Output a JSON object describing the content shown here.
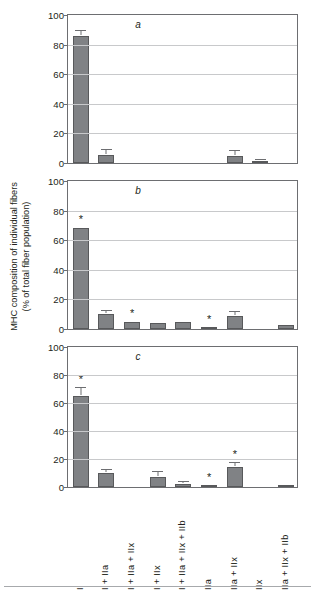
{
  "axis": {
    "y_title_line1": "MHC composition of individual fibers",
    "y_title_line2": "(% of total fiber population)",
    "y_ticks": [
      "0",
      "20",
      "40",
      "60",
      "80",
      "100"
    ]
  },
  "categories": [
    "I",
    "I + IIa",
    "I + IIa + IIx",
    "I + IIx",
    "I + IIa + IIx + IIb",
    "IIa",
    "IIa + IIx",
    "IIx",
    "IIa + IIx + IIb"
  ],
  "panels": [
    {
      "letter": "a"
    },
    {
      "letter": "b"
    },
    {
      "letter": "c"
    }
  ],
  "chart_data": {
    "type": "bar",
    "title": "",
    "xlabel": "",
    "ylabel": "MHC composition of individual fibers (% of total fiber population)",
    "ylim": [
      0,
      100
    ],
    "yticks": [
      0,
      20,
      40,
      60,
      80,
      100
    ],
    "grid": true,
    "legend": "none",
    "bar_color": "#808285",
    "categories": [
      "I",
      "I + IIa",
      "I + IIa + IIx",
      "I + IIx",
      "I + IIa + IIx + IIb",
      "IIa",
      "IIa + IIx",
      "IIx",
      "IIa + IIx + IIb"
    ],
    "panels": [
      {
        "label": "a",
        "values": [
          86,
          5.5,
          0,
          0,
          0,
          0,
          5,
          1.5,
          0
        ],
        "errors": [
          3.5,
          3,
          0,
          0,
          0,
          0,
          3,
          0.5,
          0
        ],
        "significance": [
          "",
          "",
          "",
          "",
          "",
          "",
          "",
          "",
          ""
        ]
      },
      {
        "label": "b",
        "values": [
          68,
          10,
          5,
          4,
          4.5,
          0.5,
          9,
          0,
          3
        ],
        "errors": [
          0,
          2.5,
          0,
          0,
          0,
          0,
          2.5,
          0,
          0
        ],
        "significance": [
          "*",
          "",
          "*",
          "",
          "",
          "*",
          "",
          "",
          ""
        ]
      },
      {
        "label": "c",
        "values": [
          65,
          10,
          0,
          7,
          2,
          0.5,
          14,
          0,
          1
        ],
        "errors": [
          6,
          2.5,
          0,
          3.5,
          1.5,
          0,
          3.5,
          0,
          0
        ],
        "significance": [
          "*",
          "",
          "",
          "",
          "",
          "*",
          "*",
          "",
          ""
        ]
      }
    ]
  }
}
